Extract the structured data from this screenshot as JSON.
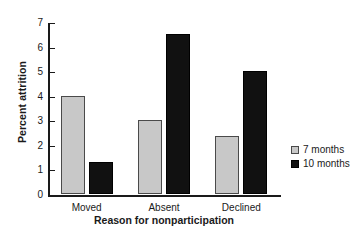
{
  "chart_data": {
    "type": "bar",
    "title": "",
    "subtitle": "",
    "xlabel": "Reason for nonparticipation",
    "ylabel": "Percent attrition",
    "categories": [
      "Moved",
      "Absent",
      "Declined"
    ],
    "series": [
      {
        "name": "7 months",
        "color": "#c8c8c8",
        "values": [
          4.0,
          3.0,
          2.35
        ]
      },
      {
        "name": "10 months",
        "color": "#111111",
        "values": [
          1.3,
          6.5,
          5.0
        ]
      }
    ],
    "ylim": [
      0,
      7
    ],
    "yticks": [
      0,
      1,
      2,
      3,
      4,
      5,
      6,
      7
    ],
    "ytick_labels": [
      "0",
      "1",
      "2",
      "3",
      "4",
      "5",
      "6",
      "7"
    ],
    "grid": false,
    "legend_position": "right"
  },
  "legend": {
    "items": [
      {
        "label": "7 months"
      },
      {
        "label": "10 months"
      }
    ]
  },
  "axes": {
    "y_title": "Percent attrition",
    "x_title": "Reason for nonparticipation"
  }
}
